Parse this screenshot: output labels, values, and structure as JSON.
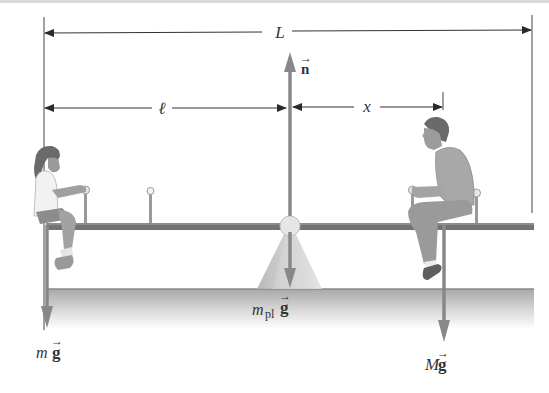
{
  "figure": {
    "colors": {
      "background": "#ffffff",
      "dimension_line": "#3a3a3a",
      "force_arrow": "#808080",
      "plank": "#6e6e6e",
      "ground_top": "#9a9a9a",
      "ground_fade": "#ffffff",
      "fulcrum": "#c4c4c4",
      "label_text": "#333333"
    }
  },
  "dimensions": {
    "total_length": {
      "symbol": "L"
    },
    "girl_distance": {
      "symbol": "ℓ"
    },
    "man_distance": {
      "symbol": "x"
    }
  },
  "forces": {
    "normal": {
      "symbol": "n",
      "vector": true,
      "direction": "up"
    },
    "girl_weight": {
      "mass": "m",
      "g": "g",
      "vector": true,
      "direction": "down"
    },
    "plank_weight": {
      "mass": "m",
      "subscript": "pl",
      "g": "g",
      "vector": true,
      "direction": "down"
    },
    "man_weight": {
      "mass": "M",
      "g": "g",
      "vector": true,
      "direction": "down"
    }
  },
  "arrow_glyph": "→"
}
